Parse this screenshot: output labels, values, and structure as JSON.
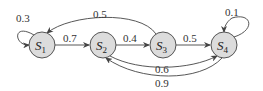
{
  "diagram": {
    "type": "markov-chain",
    "colors": {
      "node_fill": "#dcdcdc",
      "node_stroke": "#555555",
      "edge": "#444444",
      "text": "#333333"
    },
    "nodes": [
      {
        "id": "S1",
        "name": "S",
        "sub": "1"
      },
      {
        "id": "S2",
        "name": "S",
        "sub": "2"
      },
      {
        "id": "S3",
        "name": "S",
        "sub": "3"
      },
      {
        "id": "S4",
        "name": "S",
        "sub": "4"
      }
    ],
    "edges": [
      {
        "from": "S1",
        "to": "S1",
        "label": "0.3"
      },
      {
        "from": "S1",
        "to": "S2",
        "label": "0.7"
      },
      {
        "from": "S2",
        "to": "S3",
        "label": "0.4"
      },
      {
        "from": "S3",
        "to": "S1",
        "label": "0.5"
      },
      {
        "from": "S3",
        "to": "S4",
        "label": "0.5"
      },
      {
        "from": "S4",
        "to": "S4",
        "label": "0.1"
      },
      {
        "from": "S2",
        "to": "S4",
        "label": "0.6"
      },
      {
        "from": "S4",
        "to": "S2",
        "label": "0.9"
      }
    ]
  }
}
